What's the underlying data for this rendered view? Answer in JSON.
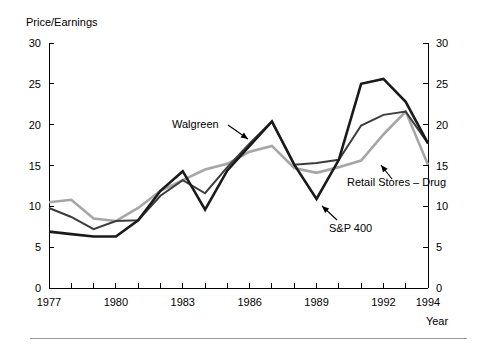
{
  "chart_data": {
    "type": "line",
    "title": "",
    "ylabel": "Price/Earnings",
    "xlabel": "Year",
    "ylim": [
      0,
      30
    ],
    "xlim": [
      1977,
      1994
    ],
    "yticks": [
      0,
      5,
      10,
      15,
      20,
      25,
      30
    ],
    "ytick_labels": [
      "0",
      "5",
      "10",
      "15",
      "20",
      "25",
      "30"
    ],
    "right_axis": true,
    "right_ytick_labels": [
      "0",
      "5",
      "10",
      "15",
      "20",
      "25",
      "30"
    ],
    "xticks": [
      1977,
      1978,
      1979,
      1980,
      1981,
      1982,
      1983,
      1984,
      1985,
      1986,
      1987,
      1988,
      1989,
      1990,
      1991,
      1992,
      1993,
      1994
    ],
    "xtick_labels_shown": [
      "1977",
      "1980",
      "1983",
      "1986",
      "1989",
      "1992",
      "1994"
    ],
    "grid": false,
    "legend_position": "inline-annotations",
    "x": [
      1977,
      1978,
      1979,
      1980,
      1981,
      1982,
      1983,
      1984,
      1985,
      1986,
      1987,
      1988,
      1989,
      1990,
      1991,
      1992,
      1993,
      1994
    ],
    "series": [
      {
        "name": "Walgreen",
        "color": "#1a1a1a",
        "width": 2.6,
        "values": [
          6.9,
          6.6,
          6.3,
          6.3,
          8.3,
          11.9,
          14.3,
          9.6,
          14.4,
          17.4,
          20.4,
          15.1,
          10.9,
          15.7,
          25.0,
          25.6,
          22.8,
          17.7
        ]
      },
      {
        "name": "S&P 400",
        "color": "#3d3d3d",
        "width": 2.0,
        "values": [
          9.8,
          8.7,
          7.2,
          8.2,
          8.3,
          11.3,
          13.2,
          11.6,
          14.8,
          17.7,
          20.4,
          15.1,
          15.3,
          15.7,
          19.9,
          21.2,
          21.6,
          17.7
        ]
      },
      {
        "name": "Retail Stores – Drug",
        "color": "#a6a6a6",
        "width": 2.6,
        "values": [
          10.5,
          10.8,
          8.5,
          8.2,
          9.8,
          11.9,
          13.2,
          14.5,
          15.2,
          16.7,
          17.4,
          14.7,
          14.1,
          14.8,
          15.6,
          18.8,
          21.6,
          15.1
        ]
      }
    ],
    "annotations": [
      {
        "text": "Walgreen",
        "label_x": 172,
        "label_y": 128,
        "arrow_from_x": 228,
        "arrow_from_y": 125,
        "arrow_to_x": 248,
        "arrow_to_y": 139
      },
      {
        "text": "Retail Stores – Drug",
        "label_x": 347,
        "label_y": 186,
        "arrow_from_x": 392,
        "arrow_from_y": 179,
        "arrow_to_x": 381,
        "arrow_to_y": 165
      },
      {
        "text": "S&P 400",
        "label_x": 329,
        "label_y": 232,
        "arrow_from_x": 337,
        "arrow_from_y": 220,
        "arrow_to_x": 322,
        "arrow_to_y": 206
      }
    ]
  },
  "figure": {
    "y_axis_title": "Price/Earnings",
    "x_axis_title": "Year"
  }
}
